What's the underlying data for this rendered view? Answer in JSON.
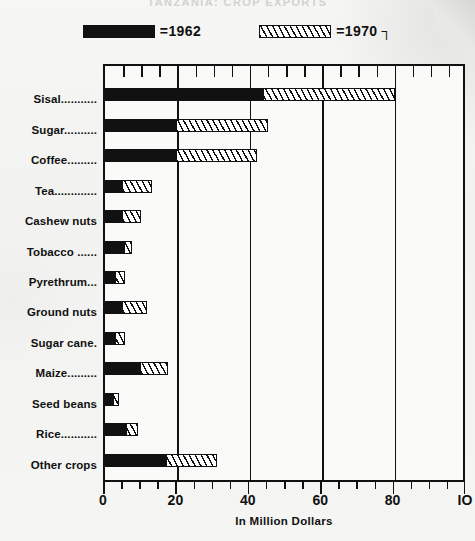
{
  "title": "TANZANIA: CROP EXPORTS",
  "legend": [
    {
      "id": "series-1962",
      "pattern": "solid",
      "label": "=1962"
    },
    {
      "id": "series-1970",
      "pattern": "hatched",
      "label": "=1970 ┐"
    }
  ],
  "axis": {
    "x_title": "In Million Dollars",
    "x_ticks": [
      "0",
      "20",
      "40",
      "60",
      "80",
      "IO"
    ],
    "x_tick_values": [
      0,
      20,
      40,
      60,
      80,
      100
    ],
    "x_minor_step": 5,
    "xmin": 0,
    "xmax": 100,
    "gridlines": [
      20,
      40,
      60,
      80
    ]
  },
  "chart_data": {
    "type": "bar",
    "orientation": "horizontal",
    "title": "TANZANIA: CROP EXPORTS",
    "xlabel": "In Million Dollars",
    "ylabel": "",
    "xlim": [
      0,
      100
    ],
    "grid": true,
    "legend_position": "top",
    "categories": [
      "Sisal...........",
      "Sugar..........",
      "Coffee.........",
      "Tea.............",
      "Cashew nuts",
      "Tobacco ......",
      "Pyrethrum...",
      "Ground nuts",
      "Sugar cane.",
      "Maize.........",
      "Seed beans",
      "Rice...........",
      "Other crops"
    ],
    "series": [
      {
        "name": "1962",
        "pattern": "solid",
        "color": "#111111",
        "values": [
          44,
          20,
          20,
          5,
          5,
          5.5,
          3,
          5,
          3,
          10,
          2.5,
          6,
          17
        ]
      },
      {
        "name": "1970",
        "pattern": "hatched",
        "color": "#ffffff",
        "values": [
          80,
          45,
          42,
          13,
          10,
          7.5,
          5.5,
          11.5,
          5.5,
          17.5,
          4,
          9,
          31
        ]
      }
    ]
  }
}
